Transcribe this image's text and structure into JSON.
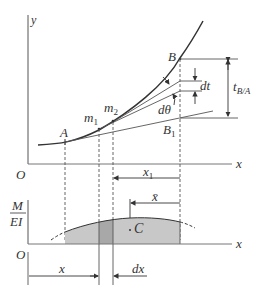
{
  "diagram": {
    "colors": {
      "line": "#333333",
      "thin_line": "#555555",
      "shade": "#c8c8c8",
      "strip": "#a8a8a8"
    },
    "upper_plot": {
      "y_axis_label": "y",
      "x_axis_label": "x",
      "origin_label": "O",
      "points": {
        "A": "A",
        "m1": "m",
        "m1_sub": "1",
        "m2": "m",
        "m2_sub": "2",
        "B": "B",
        "B1": "B",
        "B1_sub": "1"
      },
      "labels": {
        "dt": "dt",
        "dtheta": "dθ",
        "t": "t",
        "t_sub": "B/A",
        "x1": "x",
        "x1_sub": "1"
      }
    },
    "lower_plot": {
      "y_axis_label_num": "M",
      "y_axis_label_den": "EI",
      "x_axis_label": "x",
      "origin_label": "O",
      "centroid_label": "C",
      "xbar_label": "x̄",
      "x_label": "x",
      "dx_label": "dx"
    }
  }
}
